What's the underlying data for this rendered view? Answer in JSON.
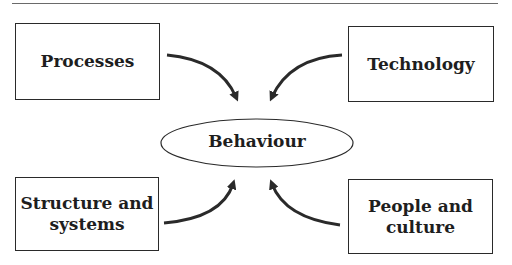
{
  "diagram": {
    "center": {
      "label": "Behaviour"
    },
    "nodes": [
      {
        "id": "processes",
        "lines": [
          "Processes"
        ],
        "position": "top-left"
      },
      {
        "id": "technology",
        "lines": [
          "Technology"
        ],
        "position": "top-right"
      },
      {
        "id": "structure-and-systems",
        "lines": [
          "Structure and",
          "systems"
        ],
        "position": "bottom-left"
      },
      {
        "id": "people-and-culture",
        "lines": [
          "People and",
          "culture"
        ],
        "position": "bottom-right"
      }
    ],
    "edges": [
      {
        "from": "processes",
        "to": "behaviour"
      },
      {
        "from": "technology",
        "to": "behaviour"
      },
      {
        "from": "structure-and-systems",
        "to": "behaviour"
      },
      {
        "from": "people-and-culture",
        "to": "behaviour"
      }
    ],
    "colors": {
      "line": "#2a2a2a",
      "text": "#1e1e1e",
      "rule": "#6a6a6a"
    }
  }
}
